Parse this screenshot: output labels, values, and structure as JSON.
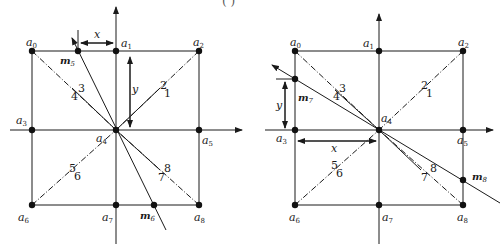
{
  "caption_fragment": "( )",
  "colors": {
    "line": "#1a1a1a",
    "background": "#ffffff"
  },
  "figures": [
    {
      "id": "left",
      "nodes": [
        {
          "name": "a",
          "sub": "0",
          "x": 32,
          "y": 51
        },
        {
          "name": "a",
          "sub": "1",
          "x": 116,
          "y": 51
        },
        {
          "name": "a",
          "sub": "2",
          "x": 199,
          "y": 51
        },
        {
          "name": "a",
          "sub": "3",
          "x": 32,
          "y": 130
        },
        {
          "name": "a",
          "sub": "4",
          "x": 116,
          "y": 130
        },
        {
          "name": "a",
          "sub": "5",
          "x": 199,
          "y": 130
        },
        {
          "name": "a",
          "sub": "6",
          "x": 32,
          "y": 205
        },
        {
          "name": "a",
          "sub": "7",
          "x": 116,
          "y": 205
        },
        {
          "name": "a",
          "sub": "8",
          "x": 199,
          "y": 205
        }
      ],
      "m_points": [
        {
          "name": "m",
          "sub": "5",
          "x": 78,
          "y": 51
        },
        {
          "name": "m",
          "sub": "6",
          "x": 154,
          "y": 205
        }
      ],
      "direction_numbers": [
        "1",
        "2",
        "3",
        "4",
        "5",
        "6",
        "7",
        "8"
      ],
      "dims": {
        "x": "x",
        "y": "y"
      }
    },
    {
      "id": "right",
      "nodes": [
        {
          "name": "a",
          "sub": "0",
          "x": 295,
          "y": 51
        },
        {
          "name": "a",
          "sub": "1",
          "x": 379,
          "y": 51
        },
        {
          "name": "a",
          "sub": "2",
          "x": 463,
          "y": 51
        },
        {
          "name": "a",
          "sub": "3",
          "x": 295,
          "y": 130
        },
        {
          "name": "a",
          "sub": "4",
          "x": 379,
          "y": 130
        },
        {
          "name": "a",
          "sub": "5",
          "x": 463,
          "y": 130
        },
        {
          "name": "a",
          "sub": "6",
          "x": 295,
          "y": 205
        },
        {
          "name": "a",
          "sub": "7",
          "x": 379,
          "y": 205
        },
        {
          "name": "a",
          "sub": "8",
          "x": 463,
          "y": 205
        }
      ],
      "m_points": [
        {
          "name": "m",
          "sub": "7",
          "x": 295,
          "y": 79
        },
        {
          "name": "m",
          "sub": "8",
          "x": 463,
          "y": 180
        }
      ],
      "direction_numbers": [
        "1",
        "2",
        "3",
        "4",
        "5",
        "6",
        "7",
        "8"
      ],
      "dims": {
        "x": "x",
        "y": "y"
      }
    }
  ]
}
